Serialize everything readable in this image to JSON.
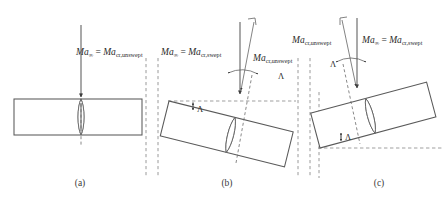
{
  "figure": {
    "title_implied": "Effect of wing sweep on critical Mach number",
    "symbols": {
      "Ma": "Ma",
      "infinity": "∞",
      "lambda": "Λ",
      "equals": "="
    },
    "panels": [
      {
        "id": "a",
        "label": "(a)",
        "label_x": 80,
        "label_y": 186,
        "configuration": "unswept",
        "sweep_angle_deg": 0,
        "equation": {
          "lhs_base": "Ma",
          "lhs_sub": "∞",
          "rel": "=",
          "rhs_base": "Ma",
          "rhs_sub": "cr,unswept",
          "x": 76,
          "y": 55
        },
        "freestream_vector": {
          "label_ref": "Ma∞",
          "x1": 81,
          "y1": 25,
          "x2": 81,
          "y2": 99
        },
        "has_lambda_marker": false
      },
      {
        "id": "b",
        "label": "(b)",
        "label_x": 227,
        "label_y": 186,
        "configuration": "swept-back",
        "sweep_angle_deg": 14,
        "equation": {
          "lhs_base": "Ma",
          "lhs_sub": "∞",
          "rel": "=",
          "rhs_base": "Ma",
          "rhs_sub": "cr,swept",
          "x": 161,
          "y": 55
        },
        "component_label": {
          "base": "Ma",
          "sub": "cr,unswept",
          "x": 253,
          "y": 61
        },
        "lambda_labels": [
          {
            "text": "Λ",
            "x": 278,
            "y": 78
          },
          {
            "text": "Λ",
            "x": 196,
            "y": 118
          }
        ],
        "freestream_vector": {
          "x1": 240,
          "y1": 22,
          "x2": 240,
          "y2": 92
        },
        "normal_vector": {
          "x1": 254,
          "y1": 20,
          "x2": 240,
          "y2": 92
        }
      },
      {
        "id": "c",
        "label": "(c)",
        "label_x": 379,
        "label_y": 186,
        "configuration": "forward-swept",
        "sweep_angle_deg": -14,
        "equation": {
          "lhs_base": "Ma",
          "lhs_sub": "∞",
          "rel": "=",
          "rhs_base": "Ma",
          "rhs_sub": "cr,swept",
          "x": 362,
          "y": 43
        },
        "component_label": {
          "base": "Ma",
          "sub": "cr,unswept",
          "x": 292,
          "y": 43
        },
        "lambda_labels": [
          {
            "text": "Λ",
            "x": 331,
            "y": 64
          },
          {
            "text": "Λ",
            "x": 345,
            "y": 146
          }
        ],
        "freestream_vector": {
          "x1": 357,
          "y1": 18,
          "x2": 357,
          "y2": 86
        },
        "normal_vector": {
          "x1": 342,
          "y1": 20,
          "x2": 357,
          "y2": 86
        }
      }
    ],
    "separators": [
      {
        "x": 146,
        "y1": 58,
        "y2": 178
      },
      {
        "x": 158,
        "y1": 58,
        "y2": 178
      },
      {
        "x": 298,
        "y1": 58,
        "y2": 178
      },
      {
        "x": 310,
        "y1": 58,
        "y2": 178
      }
    ],
    "colors": {
      "line": "#5a5a5a",
      "dash": "#8e8e8e",
      "text": "#2b2b2b",
      "background": "#ffffff",
      "arrow": "#3d3d3d"
    }
  }
}
